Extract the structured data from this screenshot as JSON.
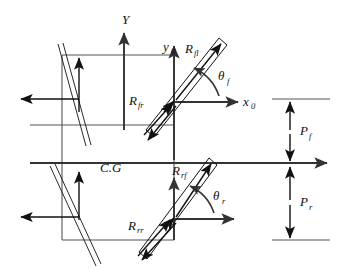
{
  "figure": {
    "type": "engineering-diagram"
  },
  "axes": {
    "global_y_label": "Y",
    "local_x_label": "x",
    "local_x_sub": "0",
    "local_y_label": "y",
    "local_y_sub": "0"
  },
  "center_of_gravity": {
    "label": "C.G"
  },
  "forces": {
    "front_left": {
      "symbol": "R",
      "subscript": "fl"
    },
    "front_right": {
      "symbol": "R",
      "subscript": "fr"
    },
    "rear_front": {
      "symbol": "R",
      "subscript": "rf"
    },
    "rear_rear": {
      "symbol": "R",
      "subscript": "rr"
    }
  },
  "angles": {
    "front_steer": {
      "symbol": "θ",
      "subscript": "f"
    },
    "rear_steer": {
      "symbol": "θ",
      "subscript": "r"
    }
  },
  "distances": {
    "front": {
      "symbol": "P",
      "subscript": "f"
    },
    "rear": {
      "symbol": "P",
      "subscript": "r"
    }
  },
  "colors": {
    "stroke": "#111111",
    "body_stroke": "#555555",
    "background": "#ffffff"
  }
}
